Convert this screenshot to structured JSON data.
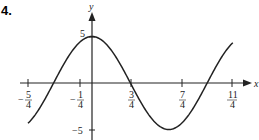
{
  "problem_number": "4.",
  "chart_data": {
    "type": "line",
    "title": "",
    "function": "y = 5cos(2πx/3)",
    "xlabel": "x",
    "ylabel": "y",
    "xlim": [
      -1.25,
      2.75
    ],
    "ylim": [
      -5,
      5
    ],
    "x_ticks": [
      {
        "value": -1.25,
        "label_num": "5",
        "label_den": "4",
        "sign": "−"
      },
      {
        "value": -0.25,
        "label_num": "1",
        "label_den": "4",
        "sign": "−"
      },
      {
        "value": 0.75,
        "label_num": "3",
        "label_den": "4",
        "sign": ""
      },
      {
        "value": 1.75,
        "label_num": "7",
        "label_den": "4",
        "sign": ""
      },
      {
        "value": 2.75,
        "label_num": "11",
        "label_den": "4",
        "sign": ""
      }
    ],
    "y_ticks": [
      {
        "value": 5,
        "label": "5"
      },
      {
        "value": -5,
        "label": "−5"
      }
    ],
    "key_points": [
      {
        "x": -1.25,
        "y": -4.33
      },
      {
        "x": -0.75,
        "y": 0
      },
      {
        "x": 0,
        "y": 5
      },
      {
        "x": 0.75,
        "y": 0
      },
      {
        "x": 1.5,
        "y": -5
      },
      {
        "x": 2.25,
        "y": 0
      },
      {
        "x": 2.75,
        "y": 4.33
      }
    ],
    "grid": false,
    "legend": null
  }
}
